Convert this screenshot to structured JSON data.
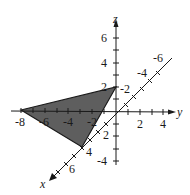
{
  "diagram": {
    "type": "3d-coordinate-axes",
    "axes": {
      "x": {
        "label": "x",
        "tick_labels": [
          "2",
          "4",
          "6"
        ]
      },
      "y": {
        "label": "y",
        "tick_labels": [
          "-8",
          "-6",
          "-4",
          "-2",
          "2",
          "4"
        ]
      },
      "z": {
        "label": "z",
        "tick_labels": [
          "6",
          "4",
          "2",
          "-4"
        ]
      },
      "x_negative_tick_labels": [
        "-2",
        "-4",
        "-6"
      ]
    },
    "triangle": {
      "vertices": [
        {
          "point": "(4, 0, 0)"
        },
        {
          "point": "(0, -8, 0)"
        },
        {
          "point": "(0, 0, 2)"
        }
      ],
      "fill_color": "#5a5a5a",
      "stroke_color": "#1a1a1a"
    },
    "colors": {
      "axis": "#1a1a1a",
      "background": "#ffffff"
    }
  }
}
